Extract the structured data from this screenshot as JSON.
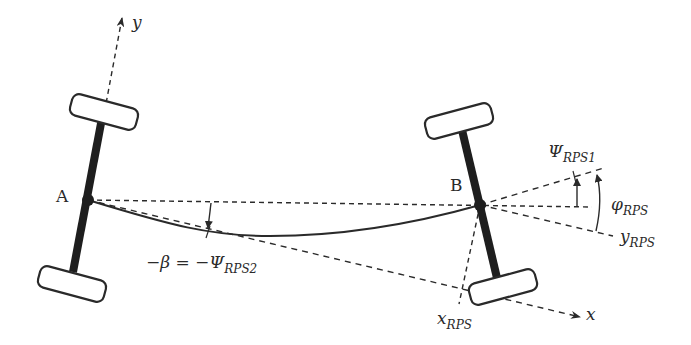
{
  "diagram": {
    "type": "vehicle kinematics diagram",
    "colors": {
      "ink": "#2a2a2a",
      "background": "#ffffff"
    },
    "points": {
      "A": {
        "label": "A"
      },
      "B": {
        "label": "B"
      }
    },
    "axes": {
      "y": {
        "label": "y"
      },
      "x": {
        "label": "x"
      }
    },
    "labels": {
      "beta_eq_lhs": "−β = −Ψ",
      "beta_eq_sub": "RPS2",
      "psi1_main": "Ψ",
      "psi1_sub": "RPS1",
      "phi_main": "φ",
      "phi_sub": "RPS",
      "yrps_main": "y",
      "yrps_sub": "RPS",
      "xrps_main": "x",
      "xrps_sub": "RPS"
    }
  }
}
